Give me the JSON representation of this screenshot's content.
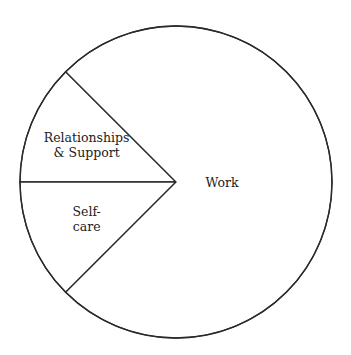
{
  "chart_data": {
    "type": "pie",
    "title": "",
    "start_angle_deg": 135,
    "direction": "counterclockwise-in-screen",
    "slices": [
      {
        "label": "Relationships & Support",
        "label_lines": [
          "Relationships",
          "& Support"
        ],
        "value": 12.5
      },
      {
        "label": "Self-care",
        "label_lines": [
          "Self-",
          "care"
        ],
        "value": 12.5
      },
      {
        "label": "Work",
        "label_lines": [
          "Work"
        ],
        "value": 75
      }
    ],
    "unit": "%",
    "legend": "none",
    "colors": {
      "fill": "#ffffff",
      "stroke": "#2a2a2a",
      "text": "#222222"
    }
  }
}
